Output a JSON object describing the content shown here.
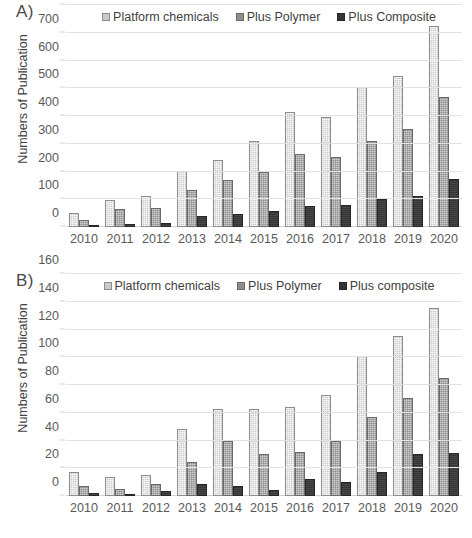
{
  "figure": {
    "panels": [
      {
        "letter": "A)",
        "ylabel": "Numbers of Publication",
        "legend": [
          "Platform chemicals",
          "Plus Polymer",
          "Plus Composite"
        ],
        "chart_data": {
          "type": "bar",
          "title": "",
          "xlabel": "",
          "ylabel": "Numbers of Publication",
          "categories": [
            "2010",
            "2011",
            "2012",
            "2013",
            "2014",
            "2015",
            "2016",
            "2017",
            "2018",
            "2019",
            "2020"
          ],
          "series": [
            {
              "name": "Platform chemicals",
              "values": [
                49,
                97,
                112,
                203,
                241,
                310,
                414,
                395,
                505,
                543,
                724
              ]
            },
            {
              "name": "Plus Polymer",
              "values": [
                25,
                66,
                69,
                135,
                170,
                199,
                264,
                251,
                311,
                354,
                469
              ]
            },
            {
              "name": "Plus Composite",
              "values": [
                5,
                12,
                15,
                39,
                46,
                56,
                76,
                80,
                102,
                112,
                172
              ]
            }
          ],
          "ylim": [
            0,
            800
          ],
          "yticks": [
            0,
            100,
            200,
            300,
            400,
            500,
            600,
            700,
            800
          ],
          "grid": true,
          "legend_position": "top-center"
        }
      },
      {
        "letter": "B)",
        "ylabel": "Numbers of Publication",
        "legend": [
          "Platform chemicals",
          "Plus Polymer",
          "Plus composite"
        ],
        "chart_data": {
          "type": "bar",
          "title": "",
          "xlabel": "",
          "ylabel": "Numbers of Publication",
          "categories": [
            "2010",
            "2011",
            "2012",
            "2013",
            "2014",
            "2015",
            "2016",
            "2017",
            "2018",
            "2019",
            "2020"
          ],
          "series": [
            {
              "name": "Platform chemicals",
              "values": [
                17,
                14,
                15.5,
                48,
                62.5,
                63,
                64,
                73,
                101,
                115,
                135.5
              ]
            },
            {
              "name": "Plus Polymer",
              "values": [
                7,
                5,
                9,
                24.5,
                39.5,
                30.5,
                32,
                39.5,
                57,
                71,
                85
              ]
            },
            {
              "name": "Plus composite",
              "values": [
                2,
                1,
                3.5,
                8.5,
                7.5,
                4.5,
                12,
                10,
                17.5,
                30.5,
                31
              ]
            }
          ],
          "ylim": [
            0,
            160
          ],
          "yticks": [
            0,
            20,
            40,
            60,
            80,
            100,
            120,
            140,
            160
          ],
          "grid": true,
          "legend_position": "top-center"
        }
      }
    ]
  }
}
